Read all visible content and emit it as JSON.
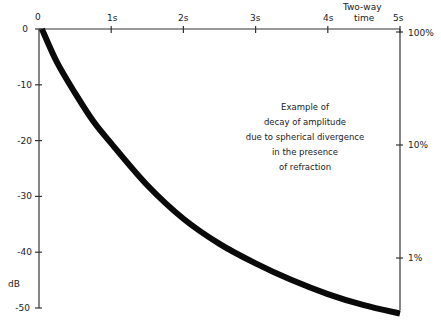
{
  "chart_data": {
    "type": "line",
    "title": "",
    "annotation": [
      "Example of",
      "decay of amplitude",
      "due to spherical divergence",
      "in the presence",
      "of refraction"
    ],
    "xlabel": "Two-way time",
    "ylabel": "dB",
    "x_axis_position": "top",
    "x_ticks": [
      "0",
      "1s",
      "2s",
      "3s",
      "4s",
      "5s"
    ],
    "x_tick_values": [
      0,
      1,
      2,
      3,
      4,
      5
    ],
    "xlim": [
      0,
      5
    ],
    "y_ticks": [
      "0",
      "-10",
      "-20",
      "-30",
      "-40",
      "-50"
    ],
    "y_tick_values": [
      0,
      -10,
      -20,
      -30,
      -40,
      -50
    ],
    "ylim": [
      -50,
      0
    ],
    "right_axis_ticks": [
      "100%",
      "10%",
      "1%"
    ],
    "right_axis_values_db": [
      0,
      -20,
      -40
    ],
    "grid": false,
    "legend": null,
    "series": [
      {
        "name": "amplitude decay",
        "x": [
          0.04,
          0.25,
          0.5,
          0.75,
          1.0,
          1.5,
          2.0,
          2.5,
          3.0,
          3.5,
          4.0,
          4.5,
          5.0
        ],
        "values": [
          0,
          -6,
          -11.5,
          -16.5,
          -20.5,
          -28,
          -34,
          -38.5,
          -42,
          -45,
          -47.5,
          -49.5,
          -51
        ]
      }
    ]
  },
  "labels": {
    "x_origin": "0",
    "x1": "1s",
    "x2": "2s",
    "x3": "3s",
    "x4": "4s",
    "x5": "5s",
    "xtitle_line1": "Two-way",
    "xtitle_line2": "time",
    "y0": "0",
    "y10": "-10",
    "y20": "-20",
    "y30": "-30",
    "y40": "-40",
    "y50": "-50",
    "yunit": "dB",
    "r100": "100%",
    "r10": "10%",
    "r1": "1%"
  },
  "colors": {
    "axis": "#333333",
    "curve": "#0a0a0a",
    "background": "#ffffff"
  }
}
